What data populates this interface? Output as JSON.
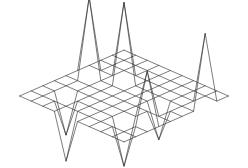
{
  "figure": {
    "title": "",
    "background_color": "#ffffff",
    "line_color": "#2b2b2b",
    "line_width": 0.62,
    "width": 248,
    "height": 168
  },
  "chart_data": {
    "type": "line",
    "subtype": "3d-wireframe-mesh-surface",
    "title": "",
    "subtitle": "",
    "xlabel": "",
    "ylabel": "",
    "zlabel": "",
    "grid": true,
    "legend": null,
    "axes_visible": false,
    "tick_labels": [],
    "annotations": [],
    "projection": {
      "kind": "isometric",
      "azimuth_deg": 37,
      "elevation_deg": 30,
      "origin_x": 124,
      "origin_y": 96,
      "unit_x_dx": 11.6,
      "unit_x_dy": 5.1,
      "unit_y_dx": -11.6,
      "unit_y_dy": 5.1,
      "unit_z_dy": -5.6
    },
    "x": [
      0,
      1,
      2,
      3,
      4,
      5,
      6,
      7,
      8,
      9
    ],
    "y": [
      0,
      1,
      2,
      3,
      4,
      5,
      6,
      7,
      8,
      9
    ],
    "xlim": [
      0,
      9
    ],
    "ylim": [
      0,
      9
    ],
    "zlim": [
      -8,
      15
    ],
    "z": [
      [
        0,
        0,
        0,
        0,
        0,
        0,
        0,
        0,
        0,
        0
      ],
      [
        0,
        0,
        0,
        0,
        0,
        0,
        0,
        0,
        0,
        0
      ],
      [
        0,
        0,
        0,
        0,
        0,
        0,
        0,
        0,
        0,
        13
      ],
      [
        0,
        0,
        0,
        14,
        0,
        0,
        0,
        0,
        0,
        0
      ],
      [
        0,
        14,
        0,
        0,
        0,
        0,
        0,
        -6,
        0,
        0
      ],
      [
        0,
        0,
        0,
        0,
        0,
        0,
        0,
        0,
        0,
        0
      ],
      [
        0,
        0,
        0,
        0,
        0,
        0,
        0,
        0,
        9,
        0
      ],
      [
        0,
        0,
        -7,
        0,
        0,
        0,
        0,
        -8,
        0,
        0
      ],
      [
        0,
        0,
        0,
        0,
        0,
        0,
        0,
        0,
        0,
        0
      ],
      [
        0,
        0,
        0,
        0,
        -8,
        0,
        0,
        0,
        0,
        0
      ]
    ],
    "peaks": [
      {
        "ix": 4,
        "iy": 1,
        "z": 14,
        "kind": "peak"
      },
      {
        "ix": 3,
        "iy": 3,
        "z": 14,
        "kind": "peak"
      },
      {
        "ix": 6,
        "iy": 8,
        "z": 9,
        "kind": "peak"
      },
      {
        "ix": 2,
        "iy": 9,
        "z": 13,
        "kind": "peak"
      },
      {
        "ix": 7,
        "iy": 2,
        "z": -7,
        "kind": "valley"
      },
      {
        "ix": 7,
        "iy": 7,
        "z": -8,
        "kind": "valley"
      },
      {
        "ix": 4,
        "iy": 7,
        "z": -6,
        "kind": "valley"
      },
      {
        "ix": 9,
        "iy": 4,
        "z": -8,
        "kind": "valley"
      }
    ]
  }
}
